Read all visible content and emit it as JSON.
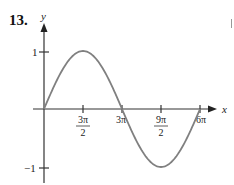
{
  "problem": {
    "number": "13."
  },
  "chart_data": {
    "type": "line",
    "title": "",
    "function_shape": "sine wave, y = sin(x/3), one full period over [0, 6π]",
    "xlabel": "x",
    "ylabel": "y",
    "x_ticks": [
      {
        "value": "3π/2",
        "num": "3π",
        "den": "2"
      },
      {
        "value": "3π",
        "num": "3π",
        "den": ""
      },
      {
        "value": "9π/2",
        "num": "9π",
        "den": "2"
      },
      {
        "value": "6π",
        "num": "6π",
        "den": ""
      }
    ],
    "y_ticks": [
      {
        "value": 1,
        "label": "1"
      },
      {
        "value": -1,
        "label": "−1"
      }
    ],
    "x": [
      0,
      1.5708,
      3.1416,
      4.7124,
      6.2832,
      7.854,
      9.4248,
      10.9956,
      12.5664,
      14.1372,
      15.708,
      17.2788,
      18.8496
    ],
    "y": [
      0,
      0.5,
      0.866,
      1,
      0.866,
      0.5,
      0,
      -0.5,
      -0.866,
      -1,
      -0.866,
      -0.5,
      0
    ],
    "key_points": [
      {
        "x": "0",
        "y": 0
      },
      {
        "x": "3π/2",
        "y": 1
      },
      {
        "x": "3π",
        "y": 0
      },
      {
        "x": "9π/2",
        "y": -1
      },
      {
        "x": "6π",
        "y": 0
      }
    ],
    "xlim": [
      0,
      18.85
    ],
    "ylim": [
      -1,
      1
    ],
    "grid": false,
    "legend": null,
    "curve_color": "#808080",
    "axis_color": "#333333"
  }
}
